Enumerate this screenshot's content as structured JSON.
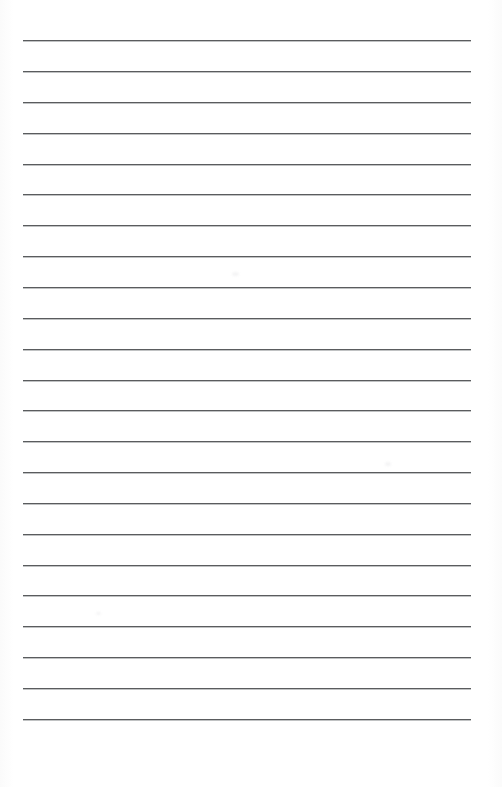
{
  "document": {
    "kind": "scanned-blank-ruled-page",
    "title": "Blank Ruled Notebook Page",
    "page_width": 502,
    "page_height": 787,
    "background_color": "#ffffff",
    "written_text": "",
    "has_handwriting": false,
    "has_printed_text": false
  },
  "ruling": {
    "line_color": "#5a5c5e",
    "line_shadow_color": "#8c8f92",
    "line_thickness": 1,
    "line_count": 23,
    "first_line_y": 40,
    "line_spacing": 30.85,
    "line_left_x": 23,
    "line_right_x": 471,
    "line_length": 448,
    "top_margin": 40,
    "bottom_margin": 68,
    "left_margin": 23,
    "right_margin": 31,
    "lines_y": [
      40,
      71,
      102,
      133,
      164,
      194,
      225,
      256,
      287,
      318,
      349,
      380,
      410,
      441,
      472,
      503,
      534,
      565,
      595,
      626,
      657,
      688,
      719
    ]
  },
  "marks": {
    "smudges": [
      {
        "x": 232,
        "y": 272,
        "w": 7,
        "h": 4
      },
      {
        "x": 385,
        "y": 462,
        "w": 6,
        "h": 4
      },
      {
        "x": 96,
        "y": 612,
        "w": 5,
        "h": 3
      }
    ]
  }
}
